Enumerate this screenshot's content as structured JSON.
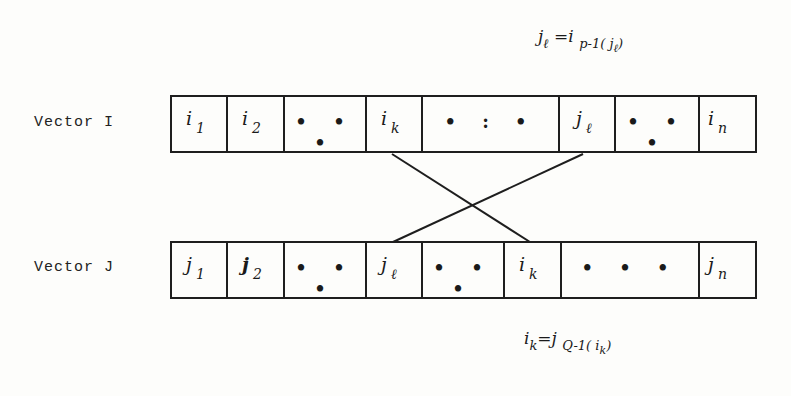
{
  "diagram": {
    "vector_i": {
      "label": "Vector I",
      "cells": [
        {
          "base": "i",
          "sub": "1"
        },
        {
          "base": "i",
          "sub": "2"
        },
        {
          "dots": "• • •"
        },
        {
          "base": "i",
          "sub": "k"
        },
        {
          "dots": "• : •"
        },
        {
          "base": "j",
          "sub": "ℓ"
        },
        {
          "dots": "• • •"
        },
        {
          "base": "i",
          "sub": "n"
        }
      ]
    },
    "vector_j": {
      "label": "Vector J",
      "cells": [
        {
          "base": "j",
          "sub": "1"
        },
        {
          "base": "j",
          "sub": "2"
        },
        {
          "dots": "• • •"
        },
        {
          "base": "j",
          "sub": "ℓ"
        },
        {
          "dots": "• • •"
        },
        {
          "base": "i",
          "sub": "k"
        },
        {
          "dots": "• • •"
        },
        {
          "base": "j",
          "sub": "n"
        }
      ]
    },
    "formula_top": {
      "lhs": "j",
      "lhs_sub": "ℓ",
      "eq": "=",
      "rhs": "i",
      "rhs_sub": "p-1",
      "arg_open": "(",
      "arg": "j",
      "arg_sub": "ℓ",
      "arg_close": ")"
    },
    "formula_bottom": {
      "lhs": "i",
      "lhs_sub": "k",
      "eq": "=",
      "rhs": "j",
      "rhs_sub": "Q-1",
      "arg_open": "(",
      "arg": "i",
      "arg_sub": "k",
      "arg_close": ")"
    },
    "connections": [
      {
        "from": "vector_i.i_k",
        "to": "vector_j.i_k"
      },
      {
        "from": "vector_i.j_l",
        "to": "vector_j.j_l"
      }
    ]
  }
}
